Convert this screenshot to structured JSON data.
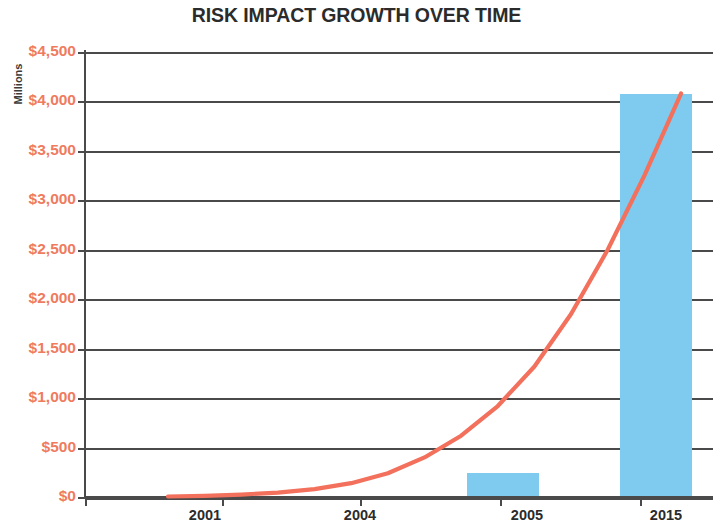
{
  "chart_data": {
    "type": "bar",
    "title": "RISK IMPACT GROWTH OVER TIME",
    "xlabel": "",
    "ylabel": "Millions",
    "categories": [
      "2001",
      "2004",
      "2005",
      "2015"
    ],
    "values": [
      0,
      0,
      240,
      4080
    ],
    "ylim": [
      0,
      4500
    ],
    "y_ticks": [
      0,
      500,
      1000,
      1500,
      2000,
      2500,
      3000,
      3500,
      4000,
      4500
    ],
    "y_tick_labels": [
      "$0",
      "$500",
      "$1,000",
      "$1,500",
      "$2,000",
      "$2,500",
      "$3,000",
      "$3,500",
      "$4,000",
      "$4,500"
    ],
    "grid": true,
    "legend": "none",
    "series": [
      {
        "name": "Risk Impact Bars",
        "type": "bar",
        "color": "#7ecbef",
        "categories": [
          "2001",
          "2004",
          "2005",
          "2015"
        ],
        "values": [
          0,
          0,
          240,
          4080
        ]
      },
      {
        "name": "Growth Trend",
        "type": "line",
        "color": "#f2705c",
        "x": [
          2001,
          2002,
          2003,
          2004,
          2005,
          2006,
          2007,
          2008,
          2009,
          2010,
          2011,
          2012,
          2013,
          2014,
          2015
        ],
        "values": [
          5,
          12,
          25,
          45,
          80,
          140,
          240,
          400,
          620,
          920,
          1320,
          1850,
          2500,
          3250,
          4080
        ]
      }
    ]
  },
  "axis": {
    "y_title": "Millions",
    "y_labels": [
      "$4,500",
      "$4,000",
      "$3,500",
      "$3,000",
      "$2,500",
      "$2,000",
      "$1,500",
      "$1,000",
      "$500",
      "$0"
    ],
    "x_labels": [
      "2001",
      "2004",
      "2005",
      "2015"
    ]
  },
  "colors": {
    "bar": "#7ecbef",
    "line": "#f2705c",
    "y_tick_text": "#ef7b5e",
    "axis": "#4a4a4a",
    "title_text": "#2b2b2b"
  }
}
